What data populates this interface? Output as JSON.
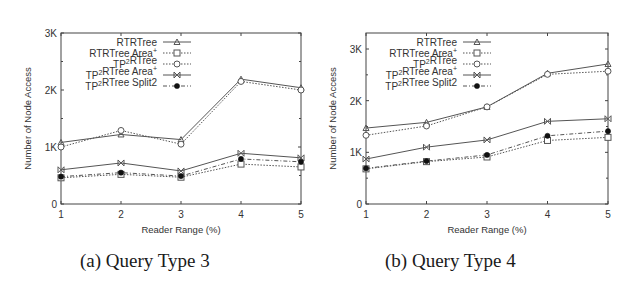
{
  "chart_data": [
    {
      "type": "line",
      "id": "a",
      "caption": "(a) Query Type 3",
      "title": "",
      "xlabel": "Reader Range (%)",
      "ylabel": "Number of Node Access",
      "x": [
        1,
        2,
        3,
        4,
        5
      ],
      "xticks": [
        "1",
        "2",
        "3",
        "4",
        "5"
      ],
      "ylim": [
        0,
        3000
      ],
      "yticks": [
        {
          "value": 0,
          "label": "0"
        },
        {
          "value": 1000,
          "label": "1K"
        },
        {
          "value": 2000,
          "label": "2K"
        },
        {
          "value": 3000,
          "label": "3K"
        }
      ],
      "grid": false,
      "legend_position": "upper-left-inside",
      "series": [
        {
          "name": "RTRTree",
          "marker": "triangle",
          "dash": "solid",
          "values": [
            1080,
            1220,
            1130,
            2190,
            2040
          ]
        },
        {
          "name": "RTRTree Area+",
          "marker": "square",
          "dash": "dotted",
          "values": [
            460,
            520,
            470,
            700,
            650
          ]
        },
        {
          "name": "TP2RTree",
          "marker": "circle",
          "dash": "dotted",
          "values": [
            1000,
            1290,
            1050,
            2150,
            2000
          ]
        },
        {
          "name": "TP2RTree Area+",
          "marker": "x",
          "dash": "solid",
          "values": [
            600,
            720,
            580,
            890,
            810
          ]
        },
        {
          "name": "TP2RTree Split2",
          "marker": "filled-circle",
          "dash": "dashdot",
          "values": [
            480,
            550,
            490,
            790,
            740
          ]
        }
      ]
    },
    {
      "type": "line",
      "id": "b",
      "caption": "(b) Query Type 4",
      "title": "",
      "xlabel": "Reader Range (%)",
      "ylabel": "Number of Node Access",
      "x": [
        1,
        2,
        3,
        4,
        5
      ],
      "xticks": [
        "1",
        "2",
        "3",
        "4",
        "5"
      ],
      "ylim": [
        0,
        3300
      ],
      "yticks": [
        {
          "value": 0,
          "label": "0"
        },
        {
          "value": 1000,
          "label": "1K"
        },
        {
          "value": 2000,
          "label": "2K"
        },
        {
          "value": 3000,
          "label": "3K"
        }
      ],
      "grid": false,
      "legend_position": "upper-left-inside",
      "series": [
        {
          "name": "RTRTree",
          "marker": "triangle",
          "dash": "solid",
          "values": [
            1470,
            1580,
            1880,
            2530,
            2710
          ]
        },
        {
          "name": "RTRTree Area+",
          "marker": "square",
          "dash": "dotted",
          "values": [
            680,
            820,
            910,
            1230,
            1290
          ]
        },
        {
          "name": "TP2RTree",
          "marker": "circle",
          "dash": "dotted",
          "values": [
            1330,
            1510,
            1880,
            2510,
            2570
          ]
        },
        {
          "name": "TP2RTree Area+",
          "marker": "x",
          "dash": "solid",
          "values": [
            870,
            1100,
            1240,
            1600,
            1650
          ]
        },
        {
          "name": "TP2RTree Split2",
          "marker": "filled-circle",
          "dash": "dashdot",
          "values": [
            690,
            830,
            950,
            1320,
            1410
          ]
        }
      ]
    }
  ],
  "legend_labels": [
    {
      "base": "RTRTree",
      "sup": "",
      "tail": ""
    },
    {
      "base": "RTRTree Area",
      "sup": "+",
      "tail": ""
    },
    {
      "base": "TP",
      "sup": "2",
      "tail": "RTree"
    },
    {
      "base": "TP",
      "sup": "2",
      "tail": "RTree Area",
      "sup2": "+"
    },
    {
      "base": "TP",
      "sup": "2",
      "tail": "RTree Split2"
    }
  ],
  "captions": {
    "a": "(a) Query Type 3",
    "b": "(b) Query Type 4"
  },
  "colors": {
    "axis": "#444444",
    "line": "#555555",
    "text": "#333333"
  }
}
